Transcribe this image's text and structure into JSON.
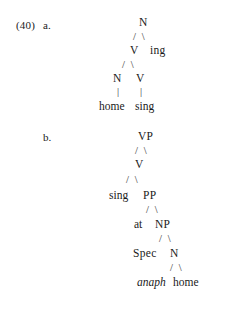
{
  "document": {
    "example_number": "(40)",
    "items": [
      {
        "letter": "a.",
        "tree_id": "tree-a",
        "levels": [
          {
            "kind": "nodes",
            "cells": [
              "N"
            ]
          },
          {
            "kind": "branch",
            "cells": [
              "/ \\"
            ]
          },
          {
            "kind": "nodes",
            "cells": [
              "V",
              "ing"
            ]
          },
          {
            "kind": "branch",
            "cells": [
              "/ \\"
            ]
          },
          {
            "kind": "nodes",
            "cells": [
              "N",
              "V"
            ]
          },
          {
            "kind": "stem",
            "cells": [
              "|",
              "|"
            ]
          },
          {
            "kind": "terminals",
            "cells": [
              "home",
              "sing"
            ]
          }
        ]
      },
      {
        "letter": "b.",
        "tree_id": "tree-b",
        "levels": [
          {
            "kind": "nodes",
            "cells": [
              "VP"
            ]
          },
          {
            "kind": "branch",
            "cells": [
              "/ \\"
            ]
          },
          {
            "kind": "nodes",
            "cells": [
              "V"
            ]
          },
          {
            "kind": "branch",
            "cells": [
              "/ \\"
            ]
          },
          {
            "kind": "mixed",
            "cells": [
              "sing",
              "PP"
            ]
          },
          {
            "kind": "branch",
            "cells": [
              "/ \\"
            ]
          },
          {
            "kind": "mixed",
            "cells": [
              "at",
              "NP"
            ]
          },
          {
            "kind": "branch",
            "cells": [
              "/ \\"
            ]
          },
          {
            "kind": "nodes",
            "cells": [
              "Spec",
              "N"
            ]
          },
          {
            "kind": "branch",
            "cells": [
              "/ \\"
            ]
          },
          {
            "kind": "terminals",
            "cells": [
              "anaph",
              "home"
            ]
          }
        ]
      }
    ],
    "tree_a": {
      "root": "N",
      "branch_1": "/ \\",
      "v_node": "V",
      "ing_node": "ing",
      "branch_2": "/ \\",
      "n_node": "N",
      "v2_node": "V",
      "stem_left": "|",
      "stem_right": "|",
      "terminal_home": "home",
      "terminal_sing": "sing"
    },
    "tree_b": {
      "root": "VP",
      "branch_1": "/ \\",
      "v_node": "V",
      "branch_2": "/ \\",
      "terminal_sing": "sing",
      "pp_node": "PP",
      "branch_3": "/ \\",
      "terminal_at": "at",
      "np_node": "NP",
      "branch_4": "/ \\",
      "spec_node": "Spec",
      "n_node": "N",
      "branch_5": "/ \\",
      "terminal_anaph": "anaph",
      "terminal_home": "home"
    }
  },
  "colors": {
    "page_background": "#ffffff",
    "text": "#1a1a1a",
    "branch": "#2a2a2a"
  }
}
